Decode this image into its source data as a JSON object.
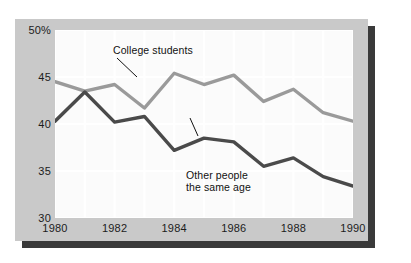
{
  "chart_data": {
    "type": "line",
    "title": "",
    "subtitle": "",
    "xlabel": "",
    "ylabel": "",
    "xlim": [
      1980,
      1990
    ],
    "ylim": [
      30,
      50
    ],
    "grid": true,
    "grid_x_step": 1,
    "grid_y_step": 5,
    "legend_position": "inline-annotations",
    "x": [
      1980,
      1981,
      1982,
      1983,
      1984,
      1985,
      1986,
      1987,
      1988,
      1989,
      1990
    ],
    "xticks": [
      1980,
      1982,
      1984,
      1986,
      1988,
      1990
    ],
    "xtick_labels": [
      "1980",
      "1982",
      "1984",
      "1986",
      "1988",
      "1990"
    ],
    "yticks": [
      30,
      35,
      40,
      45,
      50
    ],
    "ytick_labels": [
      "30",
      "35",
      "40",
      "45",
      "50%"
    ],
    "series": [
      {
        "name": "College students",
        "color": "#9a9a9a",
        "values": [
          44.5,
          43.5,
          44.2,
          41.7,
          45.4,
          44.2,
          45.2,
          42.4,
          43.7,
          41.2,
          40.3
        ]
      },
      {
        "name": "Other people the same age",
        "color": "#4a4a4a",
        "values": [
          40.3,
          43.4,
          40.2,
          40.8,
          37.2,
          38.5,
          38.1,
          35.5,
          36.4,
          34.4,
          33.4
        ]
      }
    ],
    "annotations": [
      {
        "text": "College students",
        "x": 1984,
        "y": 45.4
      },
      {
        "text": "Other people\nthe same age",
        "x": 1985,
        "y": 38.5
      }
    ]
  },
  "axis": {
    "y_labels": [
      "50%",
      "45",
      "40",
      "35",
      "30"
    ],
    "x_labels": [
      "1980",
      "1982",
      "1984",
      "1986",
      "1988",
      "1990"
    ]
  },
  "annotations": {
    "college": "College students",
    "other": "Other people\nthe same age"
  },
  "colors": {
    "panel": "#c9c9c9",
    "plot_background": "#fbfbfb",
    "gridline": "#ffffff",
    "shadow": "#3a3a3a",
    "series_college": "#9a9a9a",
    "series_other": "#4a4a4a",
    "text": "#1c1c1c"
  }
}
